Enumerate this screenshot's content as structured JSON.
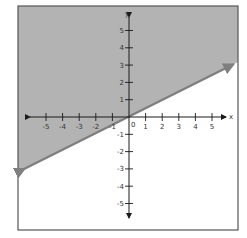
{
  "chart_data": {
    "type": "line",
    "title": "",
    "xlabel": "x",
    "ylabel": "y",
    "xlim": [
      -6.5,
      6.5
    ],
    "ylim": [
      -6.5,
      6.5
    ],
    "x_ticks": [
      -5,
      -4,
      -3,
      -2,
      -1,
      1,
      2,
      3,
      4,
      5
    ],
    "y_ticks": [
      5,
      4,
      3,
      2,
      1,
      -1,
      -2,
      -3,
      -4,
      -5
    ],
    "origin_label": "0",
    "grid": false,
    "series": [
      {
        "name": "boundary line y = 1/2 x",
        "style": "solid",
        "arrows": "both",
        "x": [
          -6.6,
          6.5
        ],
        "y": [
          -3.3,
          3.25
        ],
        "color": "#808080"
      }
    ],
    "shaded_region": "above line",
    "shade_color": "#b3b3b3"
  },
  "colors": {
    "shade": "#b3b3b3",
    "line": "#7f7f7f",
    "axis": "#1a1a1a",
    "frame": "#555555"
  }
}
